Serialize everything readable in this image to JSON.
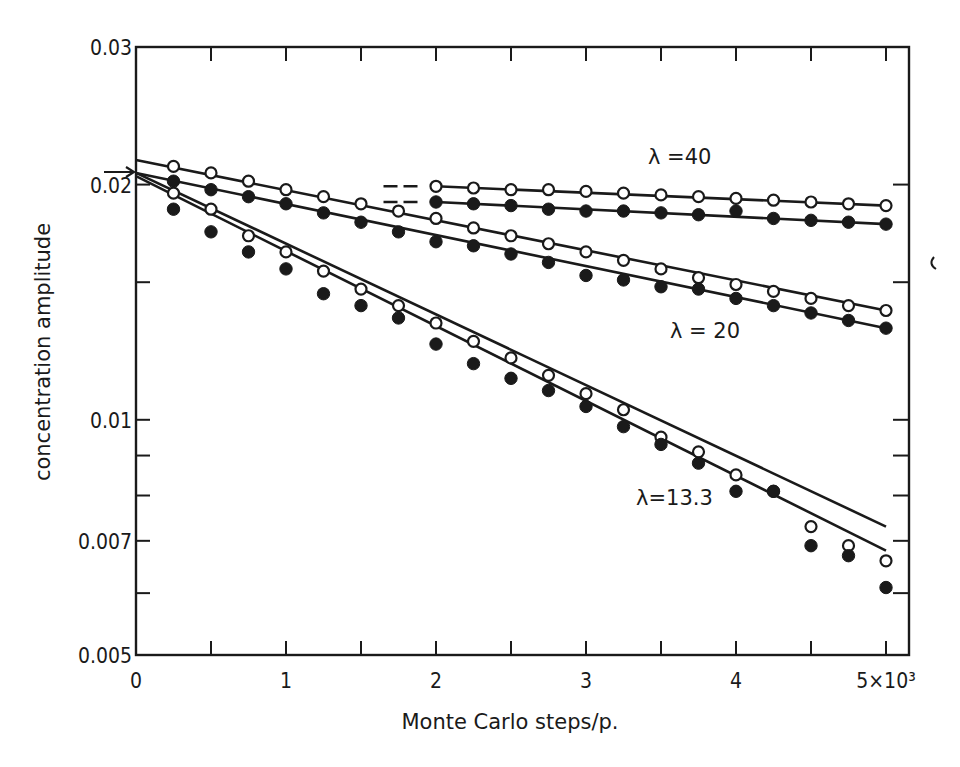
{
  "chart_data": {
    "type": "scatter",
    "title": "",
    "xlabel": "Monte Carlo steps/p.",
    "ylabel": "concentration amplitude",
    "xscale": "linear",
    "yscale": "log",
    "xlim": [
      0,
      5000
    ],
    "ylim": [
      0.005,
      0.03
    ],
    "x_ticks": [
      0,
      1000,
      2000,
      3000,
      4000,
      5000
    ],
    "x_tick_labels": [
      "0",
      "1",
      "2",
      "3",
      "4",
      "5×10³"
    ],
    "x_minor_ticks": [
      500,
      1500,
      2500,
      3500,
      4500
    ],
    "y_ticks": [
      0.005,
      0.007,
      0.01,
      0.02,
      0.03
    ],
    "y_tick_labels": [
      "0.005",
      "0.007",
      "0.01",
      "0.02",
      "0.03"
    ],
    "y_minor_ticks": [
      0.006,
      0.008,
      0.009,
      0.015
    ],
    "grid": false,
    "legend": "none (inline annotations)",
    "initial_value_arrow": 0.0207,
    "annotations": [
      {
        "text": "λ = 40",
        "x": 3450,
        "y": 0.0225
      },
      {
        "text": "λ = 20",
        "x": 3550,
        "y": 0.0147
      },
      {
        "text": "λ = 13.3",
        "x": 3200,
        "y": 0.0079
      }
    ],
    "marker_legend": {
      "open_circle": "series A (open symbols)",
      "filled_circle": "series B (filled symbols)"
    },
    "series": [
      {
        "name": "λ=40 open",
        "marker": "open",
        "x": [
          2000,
          2250,
          2500,
          2750,
          3000,
          3250,
          3500,
          3750,
          4000,
          4250,
          4500,
          4750,
          5000
        ],
        "y": [
          0.0199,
          0.0198,
          0.0197,
          0.0197,
          0.0196,
          0.0195,
          0.0194,
          0.0193,
          0.0192,
          0.0191,
          0.019,
          0.0189,
          0.0188
        ],
        "fit_line": {
          "x": [
            0,
            5000
          ],
          "y": [
            0.0212,
            0.0188
          ],
          "dashed_segment_x": [
            1650,
            1900
          ]
        }
      },
      {
        "name": "λ=40 filled",
        "marker": "filled",
        "x": [
          2000,
          2250,
          2500,
          2750,
          3000,
          3250,
          3500,
          3750,
          4000,
          4250,
          4500,
          4750,
          5000
        ],
        "y": [
          0.019,
          0.0189,
          0.0188,
          0.0186,
          0.0185,
          0.0185,
          0.0184,
          0.0183,
          0.0185,
          0.0181,
          0.018,
          0.0179,
          0.0178
        ],
        "fit_line": {
          "x": [
            0,
            5000
          ],
          "y": [
            0.0205,
            0.0178
          ],
          "dashed_segment_x": [
            1650,
            1900
          ]
        }
      },
      {
        "name": "λ=20 open",
        "marker": "open",
        "x": [
          250,
          500,
          750,
          1000,
          1250,
          1500,
          1750,
          2000,
          2250,
          2500,
          2750,
          3000,
          3250,
          3500,
          3750,
          4000,
          4250,
          4500,
          4750,
          5000
        ],
        "y": [
          0.0211,
          0.0207,
          0.0202,
          0.0197,
          0.0193,
          0.0189,
          0.0185,
          0.0181,
          0.0176,
          0.0172,
          0.0168,
          0.0164,
          0.016,
          0.0156,
          0.0152,
          0.0149,
          0.0146,
          0.0143,
          0.014,
          0.0138
        ],
        "fit_line": {
          "x": [
            0,
            5000
          ],
          "y": [
            0.0215,
            0.0138
          ]
        }
      },
      {
        "name": "λ=20 filled",
        "marker": "filled",
        "x": [
          250,
          500,
          750,
          1000,
          1250,
          1500,
          1750,
          2000,
          2250,
          2500,
          2750,
          3000,
          3250,
          3500,
          3750,
          4000,
          4250,
          4500,
          4750,
          5000
        ],
        "y": [
          0.0202,
          0.0197,
          0.0193,
          0.0189,
          0.0184,
          0.0179,
          0.0174,
          0.0169,
          0.0167,
          0.0163,
          0.0159,
          0.0153,
          0.0151,
          0.0148,
          0.0147,
          0.0143,
          0.014,
          0.0137,
          0.0134,
          0.0131
        ],
        "fit_line": {
          "x": [
            0,
            5000
          ],
          "y": [
            0.0207,
            0.0131
          ]
        }
      },
      {
        "name": "λ=13.3 open",
        "marker": "open",
        "x": [
          250,
          500,
          750,
          1000,
          1250,
          1500,
          1750,
          2000,
          2250,
          2500,
          2750,
          3000,
          3250,
          3500,
          3750,
          4000,
          4250,
          4500,
          4750,
          5000
        ],
        "y": [
          0.0195,
          0.0186,
          0.0172,
          0.0164,
          0.0155,
          0.0147,
          0.014,
          0.0133,
          0.0126,
          0.012,
          0.0114,
          0.0108,
          0.0103,
          0.0095,
          0.0091,
          0.0085,
          0.0081,
          0.0073,
          0.0069,
          0.0066
        ],
        "fit_line": {
          "x": [
            0,
            5000
          ],
          "y": [
            0.0207,
            0.0073
          ]
        }
      },
      {
        "name": "λ=13.3 filled",
        "marker": "filled",
        "x": [
          250,
          500,
          750,
          1000,
          1250,
          1500,
          1750,
          2000,
          2250,
          2500,
          2750,
          3000,
          3250,
          3500,
          3750,
          4000,
          4250,
          4500,
          4750,
          5000
        ],
        "y": [
          0.0186,
          0.0174,
          0.0164,
          0.0156,
          0.0145,
          0.014,
          0.0135,
          0.0125,
          0.0118,
          0.0113,
          0.0109,
          0.0104,
          0.0098,
          0.0093,
          0.0088,
          0.0081,
          0.0081,
          0.0069,
          0.0067,
          0.0061
        ],
        "fit_line": {
          "x": [
            0,
            5000
          ],
          "y": [
            0.0205,
            0.0068
          ]
        }
      }
    ]
  },
  "plot": {
    "ylabel": "concentration amplitude",
    "xlabel": "Monte Carlo steps/p.",
    "annotations": {
      "l40": "λ =40",
      "l20": "λ = 20",
      "l13": "λ=13.3"
    },
    "colors": {
      "ink": "#1a1a1a",
      "background": "#ffffff"
    }
  }
}
